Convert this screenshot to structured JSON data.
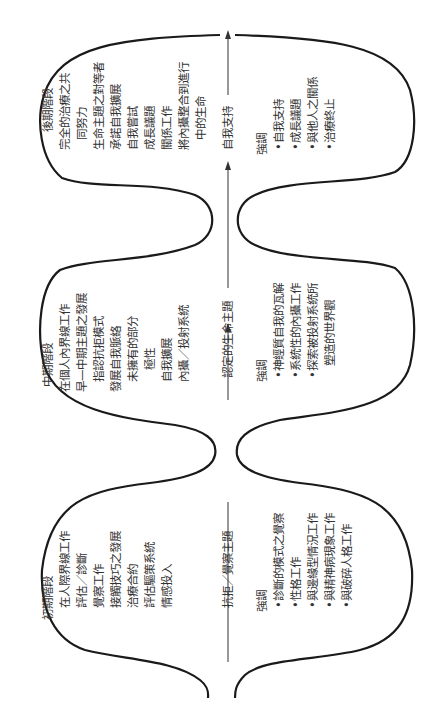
{
  "diagram": {
    "orientation": "rotated-90-ccw",
    "stages": [
      {
        "title": "初期階段",
        "items": [
          "在人際界線工作",
          "評估／診斷",
          "覺察工作",
          "接觸技巧之發展",
          "治療合約",
          "評估驅策系統",
          "情感投入"
        ],
        "theme": "抗拒／覺察主題",
        "emphasis_label": "強調",
        "emphasis": [
          "診斷的模式之覺察",
          "性格工作",
          "與邊緣型情況工作",
          "與精神病現象工作",
          "與破碎人格工作"
        ]
      },
      {
        "title": "中期階段",
        "items": [
          "在個人內界線工作",
          "早—中期主題之發展",
          "指認抗拒模式",
          "發展自我脈絡",
          "未擁有的部分",
          "極性",
          "自我擴展",
          "內攝／投射系統"
        ],
        "theme": "認定的生命主題",
        "emphasis_label": "強調",
        "emphasis": [
          "神經質自我的瓦解",
          "系統性的內攝工作",
          "探索被投射系統所",
          "塑造的世界觀"
        ]
      },
      {
        "title": "後期階段",
        "items": [
          "完全的治療之共",
          "同努力",
          "生命主題之對等者",
          "承諾自我擴展",
          "自我嘗試",
          "成長議題",
          "關係工作",
          "將內攝整合到進行",
          "中的生命"
        ],
        "theme": "自我支持",
        "emphasis_label": "強調",
        "emphasis": [
          "自我支持",
          "成長議題",
          "與他人之關係",
          "治療終止"
        ]
      }
    ],
    "bullet": "•",
    "colors": {
      "stroke": "#1a1a1a",
      "text": "#333333"
    }
  }
}
